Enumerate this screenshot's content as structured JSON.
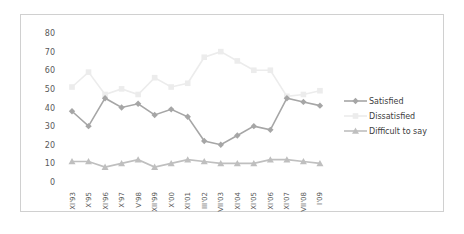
{
  "chart_data": {
    "type": "line",
    "title": "",
    "xlabel": "",
    "ylabel": "",
    "ylim": [
      0,
      80
    ],
    "yticks": [
      0,
      10,
      20,
      30,
      40,
      50,
      60,
      70,
      80
    ],
    "grid": false,
    "legend_position": "right",
    "categories": [
      "XI'93",
      "X'95",
      "XI'96",
      "X'97",
      "V'98",
      "XII'99",
      "X'00",
      "XI'01",
      "III'02",
      "VII'03",
      "XI'04",
      "XI'05",
      "XI'06",
      "XI'07",
      "VII'08",
      "I'09"
    ],
    "series": [
      {
        "name": "Satisfied",
        "marker": "diamond",
        "color": "#a6a6a6",
        "values": [
          38,
          30,
          45,
          40,
          42,
          36,
          39,
          35,
          22,
          20,
          25,
          30,
          28,
          45,
          43,
          41
        ]
      },
      {
        "name": "Dissatisfied",
        "marker": "square",
        "color": "#ececec",
        "values": [
          51,
          59,
          47,
          50,
          47,
          56,
          51,
          53,
          67,
          70,
          65,
          60,
          60,
          46,
          47,
          49
        ]
      },
      {
        "name": "Difficult to say",
        "marker": "triangle",
        "color": "#bfbfbf",
        "values": [
          11,
          11,
          8,
          10,
          12,
          8,
          10,
          12,
          11,
          10,
          10,
          10,
          12,
          12,
          11,
          10
        ]
      }
    ]
  },
  "legend": {
    "items": [
      {
        "label": "Satisfied"
      },
      {
        "label": "Dissatisfied"
      },
      {
        "label": "Difficult to say"
      }
    ]
  }
}
